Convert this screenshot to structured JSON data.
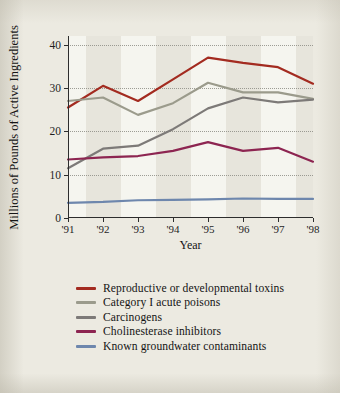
{
  "chart_data": {
    "type": "line",
    "title": "",
    "xlabel": "Year",
    "ylabel": "Millions of Pounds of Active Ingredients",
    "categories": [
      "'91",
      "'92",
      "'93",
      "'94",
      "'95",
      "'96",
      "'97",
      "'98"
    ],
    "x_tick_labels": [
      "'91",
      "'92",
      "'93",
      "'94",
      "'95",
      "'96",
      "'97",
      "'98"
    ],
    "y_tick_labels": [
      "0",
      "10",
      "20",
      "30",
      "40"
    ],
    "y_ticks": [
      0,
      10,
      20,
      30,
      40
    ],
    "ylim": [
      0,
      42
    ],
    "grid": "horizontal-dotted",
    "legend_position": "below-plot-left",
    "plot_background": "alternating vertical white and beige bands",
    "series": [
      {
        "name": "Reproductive or developmental toxins",
        "color": "#a32b20",
        "values": [
          25.5,
          30.5,
          27.0,
          32.0,
          37.0,
          35.8,
          34.8,
          31.0
        ]
      },
      {
        "name": "Category I acute poisons",
        "color": "#9b9b8c",
        "values": [
          27.0,
          27.8,
          23.8,
          26.5,
          31.2,
          29.0,
          29.0,
          27.5
        ]
      },
      {
        "name": "Carcinogens",
        "color": "#7d7a78",
        "values": [
          11.5,
          16.0,
          16.7,
          20.5,
          25.3,
          27.8,
          26.7,
          27.3
        ]
      },
      {
        "name": "Cholinesterase inhibitors",
        "color": "#8d2551",
        "values": [
          13.5,
          14.0,
          14.3,
          15.5,
          17.5,
          15.5,
          16.2,
          13.0
        ]
      },
      {
        "name": "Known groundwater contaminants",
        "color": "#6e87ad",
        "values": [
          3.5,
          3.7,
          4.1,
          4.2,
          4.3,
          4.5,
          4.4,
          4.4
        ]
      }
    ]
  },
  "legend": {
    "items": [
      {
        "label": "Reproductive or developmental toxins",
        "color": "#a32b20"
      },
      {
        "label": "Category I acute poisons",
        "color": "#9b9b8c"
      },
      {
        "label": "Carcinogens",
        "color": "#7d7a78"
      },
      {
        "label": "Cholinesterase inhibitors",
        "color": "#8d2551"
      },
      {
        "label": "Known groundwater contaminants",
        "color": "#6e87ad"
      }
    ]
  },
  "axes": {
    "y_title": "Millions of Pounds of Active Ingredients",
    "x_title": "Year"
  }
}
